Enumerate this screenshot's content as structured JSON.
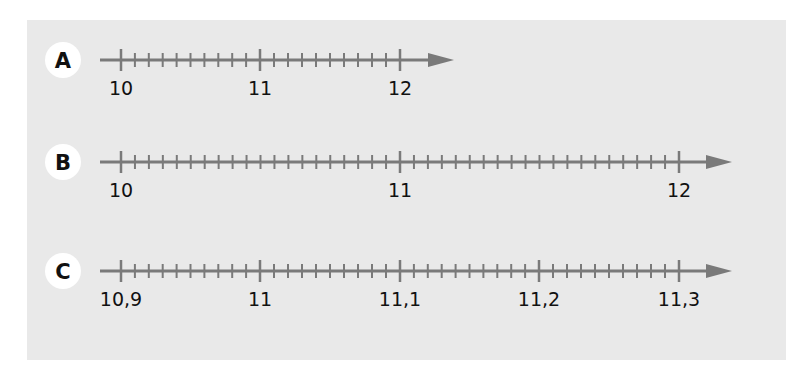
{
  "diagram": {
    "type": "number-lines",
    "colors": {
      "panel_bg": "#e9e9e9",
      "axis": "#7a7a7a",
      "label_circle": "#ffffff",
      "text": "#111111"
    },
    "lines": [
      {
        "id": "A",
        "label": "A",
        "y": 60,
        "start_x": 100,
        "arrow_tip_x": 454,
        "major_ticks": [
          {
            "x": 121,
            "label": "10"
          },
          {
            "x": 260,
            "label": "11"
          },
          {
            "x": 400,
            "label": "12"
          }
        ],
        "subdivisions_per_major": 10
      },
      {
        "id": "B",
        "label": "B",
        "y": 162,
        "start_x": 100,
        "arrow_tip_x": 732,
        "major_ticks": [
          {
            "x": 121,
            "label": "10"
          },
          {
            "x": 400,
            "label": "11"
          },
          {
            "x": 679,
            "label": "12"
          }
        ],
        "subdivisions_per_major": 20
      },
      {
        "id": "C",
        "label": "C",
        "y": 271,
        "start_x": 100,
        "arrow_tip_x": 732,
        "major_ticks": [
          {
            "x": 121,
            "label": "10,9"
          },
          {
            "x": 260,
            "label": "11"
          },
          {
            "x": 400,
            "label": "11,1"
          },
          {
            "x": 539,
            "label": "11,2"
          },
          {
            "x": 679,
            "label": "11,3"
          }
        ],
        "subdivisions_per_major": 10
      }
    ]
  }
}
